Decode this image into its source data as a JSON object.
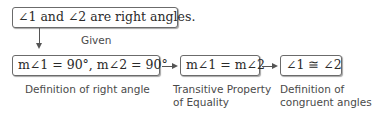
{
  "diagram": {
    "type": "flow-proof",
    "given_box": {
      "statement": "∠1 and ∠2 are right angles.",
      "reason": "Given"
    },
    "steps": [
      {
        "statement": "m∠1 = 90°, m∠2 = 90°",
        "reason": "Definition of right angle"
      },
      {
        "statement": "m∠1 = m∠2",
        "reason_line1": "Transitive Property",
        "reason_line2": "of Equality"
      },
      {
        "statement": "∠1 ≅ ∠2",
        "reason_line1": "Definition of",
        "reason_line2": "congruent angles"
      }
    ],
    "colors": {
      "border": "#6b6b6b",
      "text": "#2a2a2a",
      "label": "#4a4a4a",
      "arrow": "#555555"
    }
  }
}
